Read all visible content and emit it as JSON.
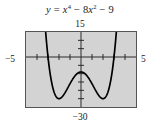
{
  "figure": {
    "equation_plain": "y = x^4 - 8x^2 - 9",
    "equation_parts": {
      "lhs": "y",
      "equals": "=",
      "term1_base": "x",
      "term1_exp": "4",
      "op1": "−",
      "term2_coeff": "8",
      "term2_base": "x",
      "term2_exp": "2",
      "op2": "−",
      "term3": "9"
    },
    "labels": {
      "y_max": "15",
      "y_min": "−30",
      "x_min": "−5",
      "x_max": "5"
    },
    "colors": {
      "plot_background": "#d3d3d3",
      "frame": "#555555",
      "curve": "#000000",
      "axis": "#2b2b2b",
      "page_background": "#ffffff"
    }
  },
  "chart_data": {
    "type": "line",
    "xlabel": "",
    "ylabel": "",
    "xlim": [
      -5,
      5
    ],
    "ylim": [
      -30,
      15
    ],
    "grid": false,
    "legend": null,
    "x_ticks": [
      -4,
      -3,
      -2,
      -1,
      1,
      2,
      3,
      4
    ],
    "y_ticks": [
      -25,
      -20,
      -15,
      -10,
      -5,
      5,
      10
    ],
    "tick_labels_shown": [
      "-5",
      "5",
      "15",
      "-30"
    ],
    "axis_style": "graphing-calculator-window",
    "series": [
      {
        "name": "y = x^4 - 8x^2 - 9",
        "x": [
          -3.55,
          -3.4,
          -3.3,
          -3.2,
          -3.1,
          -3.0,
          -2.9,
          -2.8,
          -2.6,
          -2.4,
          -2.2,
          -2.0,
          -1.8,
          -1.6,
          -1.4,
          -1.2,
          -1.0,
          -0.8,
          -0.6,
          -0.4,
          -0.2,
          0.0,
          0.2,
          0.4,
          0.6,
          0.8,
          1.0,
          1.2,
          1.4,
          1.6,
          1.8,
          2.0,
          2.2,
          2.4,
          2.6,
          2.8,
          2.9,
          3.0,
          3.1,
          3.2,
          3.3,
          3.4,
          3.55
        ],
        "y": [
          17.9,
          8.1,
          231.0,
          23.4,
          15.5,
          0.0,
          -6.6,
          -12.2,
          -20.3,
          -24.9,
          -25.6,
          -25.0,
          -23.4,
          -21.3,
          -18.8,
          -16.4,
          -16.0,
          -13.7,
          -11.8,
          -10.2,
          -9.3,
          -9.0,
          -9.3,
          -10.2,
          -11.8,
          -13.7,
          -16.0,
          -16.4,
          -18.8,
          -21.3,
          -23.4,
          -25.0,
          -25.6,
          -24.9,
          -20.3,
          -12.2,
          -6.6,
          0.0,
          15.5,
          23.4,
          31.0,
          8.1,
          17.9
        ],
        "key_points": {
          "local_maximum": [
            0,
            -9
          ],
          "local_minima": [
            [
              -2,
              -25
            ],
            [
              2,
              -25
            ]
          ],
          "x_intercepts": [
            -3,
            3
          ]
        }
      }
    ]
  }
}
